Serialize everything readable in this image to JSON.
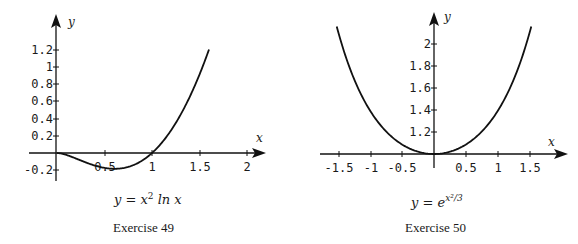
{
  "chart_data": [
    {
      "type": "line",
      "title": "y = x² ln x",
      "caption": "Exercise 49",
      "xlabel": "x",
      "ylabel": "y",
      "xlim": [
        0,
        2.2
      ],
      "ylim": [
        -0.3,
        1.35
      ],
      "x_ticks": [
        "0.5",
        "1",
        "1.5",
        "2"
      ],
      "y_ticks": [
        "-0.2",
        "0.2",
        "0.4",
        "0.6",
        "0.8",
        "1",
        "1.2"
      ],
      "grid": false,
      "series": [
        {
          "name": "y = x^2 ln x",
          "x": [
            0,
            0.2,
            0.4,
            0.607,
            0.8,
            1.0,
            1.2,
            1.4,
            1.6
          ],
          "y": [
            0,
            -0.064,
            -0.147,
            -0.184,
            -0.143,
            0,
            0.263,
            0.659,
            1.203
          ]
        }
      ]
    },
    {
      "type": "line",
      "title": "y = e^(x²/3)",
      "caption": "Exercise 50",
      "xlabel": "x",
      "ylabel": "y",
      "xlim": [
        -1.7,
        1.75
      ],
      "ylim": [
        1.0,
        2.2
      ],
      "x_ticks": [
        "-1.5",
        "-1",
        "-0.5",
        "0.5",
        "1",
        "1.5"
      ],
      "y_ticks": [
        "1.2",
        "1.4",
        "1.6",
        "1.8",
        "2"
      ],
      "grid": false,
      "series": [
        {
          "name": "y = e^(x^2/3)",
          "x": [
            -1.5,
            -1.0,
            -0.5,
            0,
            0.5,
            1.0,
            1.5
          ],
          "y": [
            2.117,
            1.396,
            1.087,
            1.0,
            1.087,
            1.396,
            2.117
          ]
        }
      ]
    }
  ],
  "left": {
    "xlabel": "x",
    "ylabel": "y",
    "x_ticks": [
      {
        "label": "0.5",
        "px": 105
      },
      {
        "label": "1",
        "px": 152
      },
      {
        "label": "1.5",
        "px": 200
      },
      {
        "label": "2",
        "px": 247
      }
    ],
    "y_ticks": [
      {
        "label": "1.2",
        "py": 50
      },
      {
        "label": "1",
        "py": 67
      },
      {
        "label": "0.8",
        "py": 84
      },
      {
        "label": "0.6",
        "py": 101
      },
      {
        "label": "0.4",
        "py": 119
      },
      {
        "label": "0.2",
        "py": 136
      },
      {
        "label": "-0.2",
        "py": 170
      }
    ],
    "formula_prefix": "y = x",
    "formula_sup": "2",
    "formula_suffix": " ln x",
    "caption": "Exercise 49"
  },
  "right": {
    "xlabel": "x",
    "ylabel": "y",
    "x_ticks": [
      {
        "label": "-1.5",
        "px": 339
      },
      {
        "label": "-1",
        "px": 371
      },
      {
        "label": "-0.5",
        "px": 402
      },
      {
        "label": "0.5",
        "px": 466
      },
      {
        "label": "1",
        "px": 498
      },
      {
        "label": "1.5",
        "px": 530
      }
    ],
    "y_ticks": [
      {
        "label": "2",
        "py": 44
      },
      {
        "label": "1.8",
        "py": 66
      },
      {
        "label": "1.6",
        "py": 88
      },
      {
        "label": "1.4",
        "py": 110
      },
      {
        "label": "1.2",
        "py": 132
      }
    ],
    "formula_prefix": "y = e",
    "formula_sup": "x²/3",
    "caption": "Exercise 50"
  }
}
